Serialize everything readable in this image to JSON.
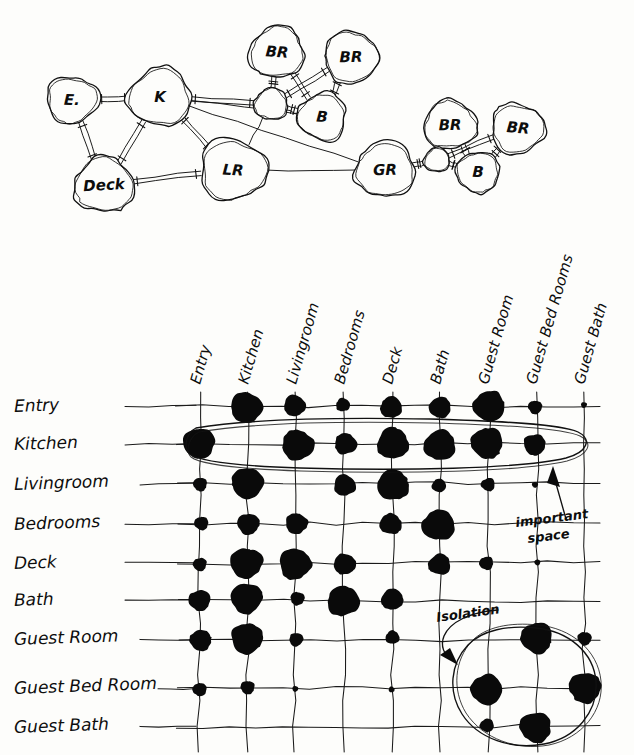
{
  "bubble_diagram": {
    "name": "room-relationship-bubble-diagram",
    "nodes": [
      {
        "id": "E",
        "label": "E.",
        "cx": 72,
        "cy": 100,
        "rx": 26,
        "ry": 24
      },
      {
        "id": "K",
        "label": "K",
        "cx": 160,
        "cy": 97,
        "rx": 32,
        "ry": 30
      },
      {
        "id": "BR1",
        "label": "BR",
        "cx": 277,
        "cy": 52,
        "rx": 28,
        "ry": 26
      },
      {
        "id": "BR2",
        "label": "BR",
        "cx": 351,
        "cy": 57,
        "rx": 28,
        "ry": 26
      },
      {
        "id": "H1",
        "label": "",
        "cx": 271,
        "cy": 104,
        "rx": 17,
        "ry": 16
      },
      {
        "id": "B1",
        "label": "B",
        "cx": 322,
        "cy": 117,
        "rx": 25,
        "ry": 24
      },
      {
        "id": "LR",
        "label": "LR",
        "cx": 233,
        "cy": 170,
        "rx": 34,
        "ry": 31
      },
      {
        "id": "Deck",
        "label": "Deck",
        "cx": 104,
        "cy": 185,
        "rx": 30,
        "ry": 28
      },
      {
        "id": "GR",
        "label": "GR",
        "cx": 385,
        "cy": 170,
        "rx": 30,
        "ry": 28
      },
      {
        "id": "BR3",
        "label": "BR",
        "cx": 450,
        "cy": 125,
        "rx": 27,
        "ry": 25
      },
      {
        "id": "BR4",
        "label": "BR",
        "cx": 518,
        "cy": 128,
        "rx": 27,
        "ry": 25
      },
      {
        "id": "H2",
        "label": "",
        "cx": 437,
        "cy": 160,
        "rx": 13,
        "ry": 12
      },
      {
        "id": "B2",
        "label": "B",
        "cx": 478,
        "cy": 172,
        "rx": 22,
        "ry": 21
      }
    ],
    "edges": [
      {
        "from": "E",
        "to": "K",
        "strength": "double"
      },
      {
        "from": "E",
        "to": "Deck",
        "strength": "double"
      },
      {
        "from": "K",
        "to": "Deck",
        "strength": "double"
      },
      {
        "from": "K",
        "to": "LR",
        "strength": "double"
      },
      {
        "from": "K",
        "to": "H1",
        "strength": "double"
      },
      {
        "from": "K",
        "to": "B1",
        "strength": "single"
      },
      {
        "from": "K",
        "to": "GR",
        "strength": "single"
      },
      {
        "from": "Deck",
        "to": "LR",
        "strength": "double"
      },
      {
        "from": "LR",
        "to": "H1",
        "strength": "single"
      },
      {
        "from": "LR",
        "to": "GR",
        "strength": "single"
      },
      {
        "from": "H1",
        "to": "BR1",
        "strength": "double"
      },
      {
        "from": "H1",
        "to": "BR2",
        "strength": "double"
      },
      {
        "from": "H1",
        "to": "B1",
        "strength": "double"
      },
      {
        "from": "BR1",
        "to": "B1",
        "strength": "double"
      },
      {
        "from": "BR2",
        "to": "B1",
        "strength": "double"
      },
      {
        "from": "GR",
        "to": "H2",
        "strength": "double"
      },
      {
        "from": "H2",
        "to": "BR3",
        "strength": "double"
      },
      {
        "from": "H2",
        "to": "BR4",
        "strength": "double"
      },
      {
        "from": "H2",
        "to": "B2",
        "strength": "double"
      },
      {
        "from": "BR3",
        "to": "B2",
        "strength": "double"
      },
      {
        "from": "BR4",
        "to": "B2",
        "strength": "double"
      }
    ]
  },
  "matrix": {
    "name": "adjacency-matrix",
    "row_labels": [
      "Entry",
      "Kitchen",
      "Livingroom",
      "Bedrooms",
      "Deck",
      "Bath",
      "Guest Room",
      "Guest Bed Room",
      "Guest Bath"
    ],
    "column_labels": [
      "Entry",
      "Kitchen",
      "Livingroom",
      "Bedrooms",
      "Deck",
      "Bath",
      "Guest Room",
      "Guest Bed Rooms",
      "Guest Bath"
    ],
    "legend": "dot size encodes strength of adjacency / relationship",
    "sizes": {
      "none": 0,
      "tiny": 3,
      "small": 7,
      "medium": 11,
      "large": 16
    },
    "cells": [
      [
        "none",
        "large",
        "medium",
        "small",
        "medium",
        "medium",
        "large",
        "small",
        "tiny"
      ],
      [
        "large",
        "none",
        "large",
        "medium",
        "large",
        "large",
        "large",
        "medium",
        "none"
      ],
      [
        "small",
        "large",
        "none",
        "medium",
        "large",
        "small",
        "small",
        "tiny",
        "none"
      ],
      [
        "small",
        "medium",
        "medium",
        "none",
        "medium",
        "large",
        "none",
        "none",
        "none"
      ],
      [
        "small",
        "large",
        "large",
        "medium",
        "none",
        "medium",
        "small",
        "tiny",
        "none"
      ],
      [
        "medium",
        "large",
        "small",
        "large",
        "medium",
        "none",
        "none",
        "none",
        "none"
      ],
      [
        "medium",
        "large",
        "small",
        "none",
        "small",
        "none",
        "none",
        "large",
        "small"
      ],
      [
        "small",
        "small",
        "tiny",
        "none",
        "tiny",
        "none",
        "large",
        "none",
        "large"
      ],
      [
        "none",
        "none",
        "none",
        "none",
        "none",
        "none",
        "small",
        "large",
        "none"
      ]
    ]
  },
  "annotations": [
    {
      "id": "important-space",
      "text_line1": "important",
      "text_line2": "space",
      "points_to": "kitchen-row-highlight"
    },
    {
      "id": "isolation",
      "text_line1": "Isolation",
      "text_line2": "",
      "points_to": "guest-wing-circle"
    }
  ],
  "colors": {
    "ink": "#111111",
    "paper": "#fdfdfb",
    "dot": "#0a0a0a"
  }
}
